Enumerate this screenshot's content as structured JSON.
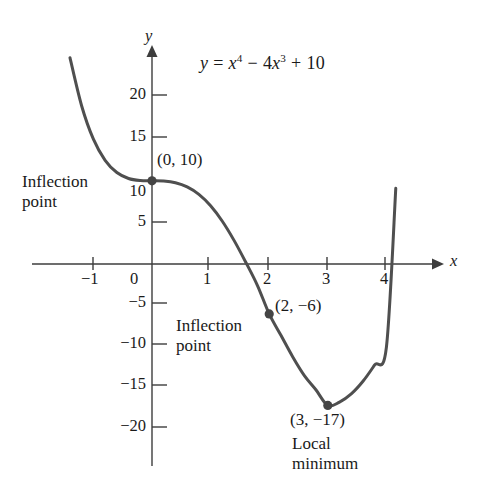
{
  "figure": {
    "background_color": "#ffffff",
    "curve_color": "#4f4f4f",
    "axis_color": "#3d3d3d",
    "text_color": "#1a1a1a",
    "point_color": "#454545"
  },
  "equation": {
    "lhs": "y",
    "equals": "=",
    "term1_base": "x",
    "term1_exp": "4",
    "minus": "−",
    "term2_coef": "4",
    "term2_base": "x",
    "term2_exp": "3",
    "plus": "+",
    "constant": "10",
    "plain": "y = x⁴ − 4x³ + 10"
  },
  "axes": {
    "x_label": "x",
    "y_label": "y",
    "x_ticks": [
      "−1",
      "0",
      "1",
      "2",
      "3",
      "4"
    ],
    "x_tick_values": [
      -1,
      0,
      1,
      2,
      3,
      4
    ],
    "y_ticks": [
      "20",
      "15",
      "10",
      "5",
      "−5",
      "−10",
      "−15",
      "−20"
    ],
    "y_tick_values": [
      20,
      15,
      10,
      5,
      -5,
      -10,
      -15,
      -20
    ],
    "xlim": [
      -1.55,
      4.6
    ],
    "ylim": [
      -23,
      26
    ]
  },
  "annotations": [
    {
      "id": "inflection-0-10",
      "point_label": "(0, 10)",
      "note_line1": "Inflection",
      "note_line2": "point",
      "x": 0,
      "y": 10
    },
    {
      "id": "inflection-2-neg6",
      "point_label": "(2, −6)",
      "note_line1": "Inflection",
      "note_line2": "point",
      "x": 2,
      "y": -6
    },
    {
      "id": "local-minimum-3-neg17",
      "point_label": "(3, −17)",
      "note_line1": "Local",
      "note_line2": "minimum",
      "x": 3,
      "y": -17
    }
  ],
  "chart_data": {
    "type": "line",
    "title": "",
    "xlabel": "x",
    "ylabel": "y",
    "function": "y = x^4 - 4x^3 + 10",
    "xlim": [
      -1.55,
      4.6
    ],
    "ylim": [
      -23,
      26
    ],
    "grid": false,
    "legend": "none",
    "series": [
      {
        "name": "y = x⁴ − 4x³ + 10",
        "x": [
          -1.4,
          -1.2,
          -1.0,
          -0.8,
          -0.6,
          -0.4,
          -0.2,
          0.0,
          0.2,
          0.4,
          0.6,
          0.8,
          1.0,
          1.2,
          1.4,
          1.6,
          1.8,
          2.0,
          2.2,
          2.4,
          2.6,
          2.8,
          3.0,
          3.2,
          3.4,
          3.6,
          3.8,
          4.0,
          4.16
        ],
        "y": [
          24.8,
          18.99,
          15.0,
          12.46,
          10.99,
          10.28,
          10.03,
          10.0,
          9.97,
          9.77,
          9.27,
          8.37,
          7.0,
          5.14,
          2.84,
          0.21,
          -2.59,
          -6.0,
          -8.57,
          -11.14,
          -13.41,
          -15.15,
          -17.0,
          -16.6,
          -15.62,
          -14.1,
          -12.13,
          -10.0,
          9.1
        ]
      }
    ],
    "annotated_points": [
      {
        "label": "(0, 10)",
        "x": 0,
        "y": 10,
        "kind": "inflection point"
      },
      {
        "label": "(2, −6)",
        "x": 2,
        "y": -6,
        "kind": "inflection point"
      },
      {
        "label": "(3, −17)",
        "x": 3,
        "y": -17,
        "kind": "local minimum"
      }
    ]
  }
}
